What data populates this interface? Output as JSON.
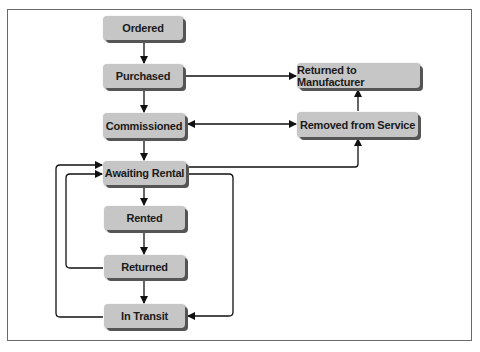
{
  "diagram": {
    "type": "state-flow",
    "nodes": [
      {
        "id": "ordered",
        "label": "Ordered"
      },
      {
        "id": "purchased",
        "label": "Purchased"
      },
      {
        "id": "commissioned",
        "label": "Commissioned"
      },
      {
        "id": "awaiting_rental",
        "label": "Awaiting Rental"
      },
      {
        "id": "rented",
        "label": "Rented"
      },
      {
        "id": "returned",
        "label": "Returned"
      },
      {
        "id": "in_transit",
        "label": "In Transit"
      },
      {
        "id": "returned_to_manufacturer",
        "label": "Returned to Manufacturer"
      },
      {
        "id": "removed_from_service",
        "label": "Removed from Service"
      }
    ],
    "edges": [
      {
        "from": "ordered",
        "to": "purchased"
      },
      {
        "from": "purchased",
        "to": "commissioned"
      },
      {
        "from": "purchased",
        "to": "returned_to_manufacturer"
      },
      {
        "from": "commissioned",
        "to": "awaiting_rental"
      },
      {
        "from": "commissioned",
        "to": "removed_from_service",
        "bidirectional": true
      },
      {
        "from": "removed_from_service",
        "to": "returned_to_manufacturer"
      },
      {
        "from": "awaiting_rental",
        "to": "removed_from_service"
      },
      {
        "from": "awaiting_rental",
        "to": "rented"
      },
      {
        "from": "awaiting_rental",
        "to": "in_transit"
      },
      {
        "from": "rented",
        "to": "returned"
      },
      {
        "from": "returned",
        "to": "awaiting_rental"
      },
      {
        "from": "returned",
        "to": "in_transit"
      },
      {
        "from": "in_transit",
        "to": "awaiting_rental"
      }
    ]
  }
}
